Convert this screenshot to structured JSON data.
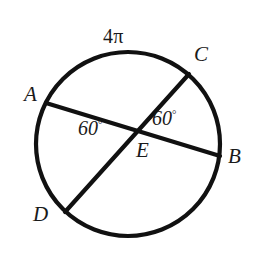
{
  "figure": {
    "type": "circle-with-intersecting-chords",
    "stroke_color": "#111111",
    "background_color": "#ffffff",
    "labels": {
      "arc_measure": "4π",
      "point_a": "A",
      "point_b": "B",
      "point_c": "C",
      "point_d": "D",
      "point_e": "E",
      "angle_left": "60",
      "angle_left_unit": "°",
      "angle_right": "60",
      "angle_right_unit": "°"
    },
    "geometry": {
      "circle": {
        "cx": 128,
        "cy": 144,
        "r": 92
      },
      "chord_ab": {
        "x1": 46,
        "y1": 103,
        "x2": 220,
        "y2": 156
      },
      "chord_cd": {
        "x1": 189,
        "y1": 74,
        "x2": 65,
        "y2": 212
      },
      "intersection_e": {
        "x": 143,
        "y": 136
      }
    }
  }
}
